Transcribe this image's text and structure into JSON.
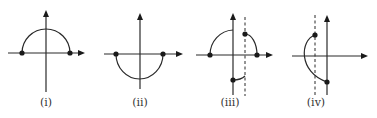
{
  "figure": {
    "background": "#ffffff",
    "stroke_color": "#2a2a2a",
    "panels": [
      {
        "id": "i",
        "label": "(i)",
        "label_pos": [
          46,
          106
        ],
        "h_axis": {
          "x1": 8,
          "x2": 85,
          "y": 53
        },
        "v_axis": {
          "x": 46,
          "y1": 10,
          "y2": 92
        },
        "dashed_lines": [],
        "arcs": [
          "M22,53 A24,24 0 0 1 70,53"
        ],
        "dots": [
          [
            22,
            53
          ],
          [
            70,
            53
          ]
        ],
        "description": "Upper semicircle centered on origin with endpoints on x-axis"
      },
      {
        "id": "ii",
        "label": "(ii)",
        "label_pos": [
          140,
          106
        ],
        "h_axis": {
          "x1": 104,
          "x2": 183,
          "y": 54
        },
        "v_axis": {
          "x": 140,
          "y1": 13,
          "y2": 89
        },
        "dashed_lines": [],
        "arcs": [
          "M116,54 A23.5,25 0 0 0 163,54"
        ],
        "dots": [
          [
            116,
            54
          ],
          [
            163,
            54
          ]
        ],
        "description": "Lower semicircle centered on origin with endpoints on x-axis"
      },
      {
        "id": "iii",
        "label": "(iii)",
        "label_pos": [
          230,
          106
        ],
        "h_axis": {
          "x1": 196,
          "x2": 273,
          "y": 55
        },
        "v_axis": {
          "x": 233,
          "y1": 13,
          "y2": 95
        },
        "dashed_lines": [
          {
            "x": 245,
            "y1": 17,
            "y2": 96
          }
        ],
        "arcs": [
          "M210,55 A24,25 0 0 1 233,30",
          "M245,34 A12,21 0 0 1 257,55",
          "M233,80 Q241,80 245,76"
        ],
        "dots": [
          [
            210,
            55
          ],
          [
            257,
            55
          ],
          [
            245,
            34
          ],
          [
            233,
            80
          ]
        ],
        "description": "Piecewise arcs split by vertical axis and dashed line"
      },
      {
        "id": "iv",
        "label": "(iv)",
        "label_pos": [
          316,
          106
        ],
        "h_axis": {
          "x1": 292,
          "x2": 368,
          "y": 56
        },
        "v_axis": {
          "x": 327,
          "y1": 15,
          "y2": 95
        },
        "dashed_lines": [
          {
            "x": 315,
            "y1": 15,
            "y2": 97
          }
        ],
        "arcs": [
          "M315,35 C300,40 298,72 327,82"
        ],
        "dots": [
          [
            315,
            35
          ],
          [
            327,
            82
          ]
        ],
        "description": "Left-bulging arc between dashed line and vertical axis"
      }
    ]
  }
}
